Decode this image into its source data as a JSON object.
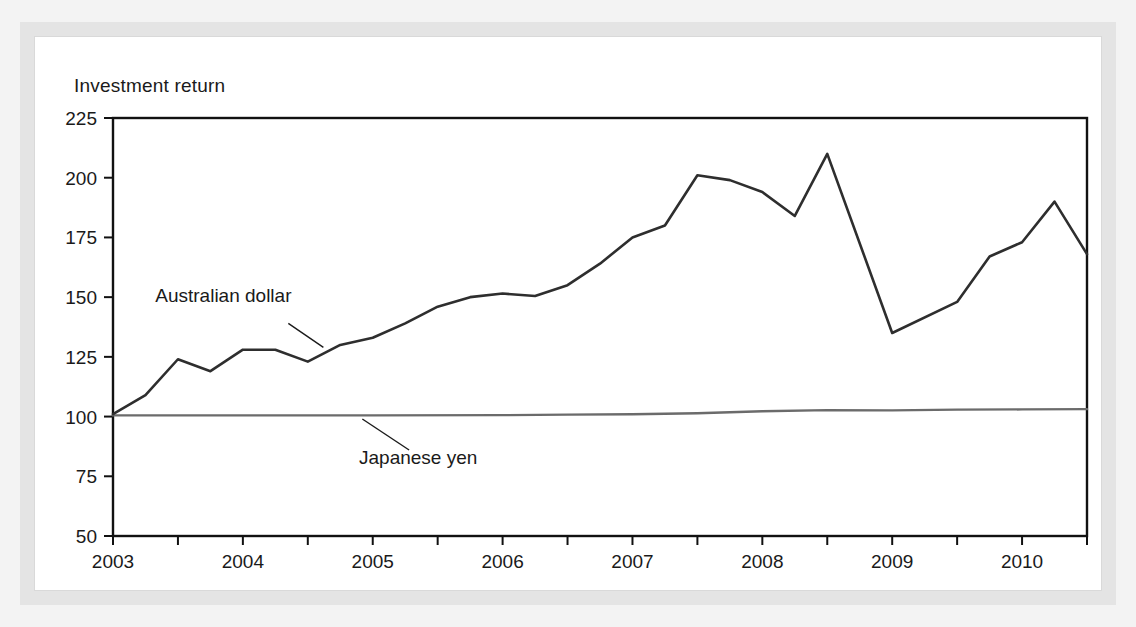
{
  "figure": {
    "title": "Investment return",
    "frame_color": "#e4e4e4",
    "panel_color": "#ffffff",
    "page_color": "#f3f3f3"
  },
  "chart_data": {
    "type": "line",
    "title": "Investment return",
    "xlabel": "",
    "ylabel": "",
    "xlim": [
      2003.0,
      2010.5
    ],
    "ylim": [
      50,
      225
    ],
    "grid": false,
    "legend": "inline-annotations",
    "y_ticks": [
      50,
      75,
      100,
      125,
      150,
      175,
      200,
      225
    ],
    "y_tick_labels": [
      "50",
      "75",
      "100",
      "125",
      "150",
      "175",
      "200",
      "225"
    ],
    "x_ticks": [
      2003,
      2003.5,
      2004,
      2004.5,
      2005,
      2005.5,
      2006,
      2006.5,
      2007,
      2007.5,
      2008,
      2008.5,
      2009,
      2009.5,
      2010,
      2010.5
    ],
    "x_tick_labels": [
      "2003",
      "2004",
      "2005",
      "2006",
      "2007",
      "2008",
      "2009",
      "2010"
    ],
    "x_labeled_ticks": [
      2003,
      2004,
      2005,
      2006,
      2007,
      2008,
      2009,
      2010
    ],
    "series": [
      {
        "name": "Australian dollar",
        "color": "#2e2e2e",
        "label_position": {
          "x": 2003.85,
          "y": 148
        },
        "leader_from": {
          "x": 2004.35,
          "y": 139
        },
        "leader_to": {
          "x": 2004.62,
          "y": 129
        },
        "x": [
          2003.0,
          2003.25,
          2003.5,
          2003.75,
          2004.0,
          2004.25,
          2004.5,
          2004.75,
          2005.0,
          2005.25,
          2005.5,
          2005.75,
          2006.0,
          2006.25,
          2006.5,
          2006.75,
          2007.0,
          2007.25,
          2007.5,
          2007.75,
          2008.0,
          2008.25,
          2008.5,
          2009.0,
          2009.5,
          2009.75,
          2010.0,
          2010.25,
          2010.5
        ],
        "y": [
          101,
          109,
          124,
          119,
          128,
          128,
          123,
          130,
          133,
          139,
          146,
          150,
          151.5,
          150.5,
          155,
          164,
          175,
          180,
          201,
          199,
          194,
          184,
          210,
          135,
          148,
          167,
          173,
          190,
          168
        ]
      },
      {
        "name": "Japanese yen",
        "color": "#6b6b6b",
        "label_position": {
          "x": 2005.35,
          "y": 80
        },
        "leader_from": {
          "x": 2005.28,
          "y": 86
        },
        "leader_to": {
          "x": 2004.92,
          "y": 99
        },
        "x": [
          2003.0,
          2004.0,
          2005.0,
          2006.0,
          2006.5,
          2007.0,
          2007.5,
          2008.0,
          2008.5,
          2009.0,
          2009.5,
          2010.0,
          2010.5
        ],
        "y": [
          100.5,
          100.5,
          100.5,
          100.6,
          100.8,
          101.0,
          101.4,
          102.2,
          102.7,
          102.6,
          102.9,
          103.0,
          103.1
        ]
      }
    ]
  }
}
